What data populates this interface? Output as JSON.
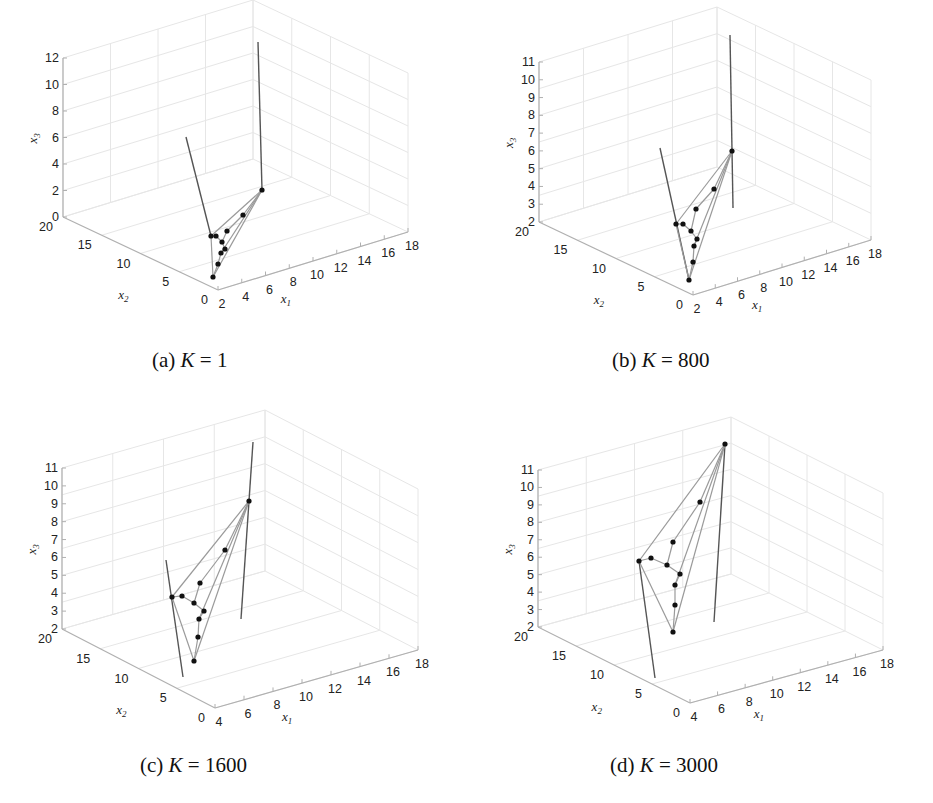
{
  "chart_data": [
    {
      "type": "scatter3d",
      "panel": "a",
      "caption": {
        "prefix": "(a) ",
        "var": "K",
        "eq": " = ",
        "value": "1"
      },
      "xlabel": "x1",
      "ylabel": "x2",
      "zlabel": "x3",
      "x1_ticks": [
        "2",
        "4",
        "6",
        "8",
        "10",
        "12",
        "14",
        "16",
        "18"
      ],
      "x2_ticks": [
        "0",
        "5",
        "10",
        "15",
        "20"
      ],
      "x3_ticks": [
        "0",
        "2",
        "4",
        "6",
        "8",
        "10",
        "12"
      ],
      "xlim": [
        2,
        18
      ],
      "ylim": [
        0,
        20
      ],
      "zlim": [
        0,
        12
      ],
      "grid": true,
      "points_px": [
        [
          262,
          190
        ],
        [
          243,
          215
        ],
        [
          227,
          231
        ],
        [
          211,
          236
        ],
        [
          216,
          236
        ],
        [
          222,
          242
        ],
        [
          225,
          249
        ],
        [
          221,
          253
        ],
        [
          218,
          264
        ],
        [
          213,
          277
        ]
      ],
      "rods_px": [
        [
          [
            186,
            137
          ],
          [
            211,
            236
          ]
        ],
        [
          [
            258,
            42
          ],
          [
            262,
            190
          ]
        ]
      ]
    },
    {
      "type": "scatter3d",
      "panel": "b",
      "caption": {
        "prefix": "(b) ",
        "var": "K",
        "eq": " = ",
        "value": "800"
      },
      "xlabel": "x1",
      "ylabel": "x2",
      "zlabel": "x3",
      "x1_ticks": [
        "2",
        "4",
        "6",
        "8",
        "10",
        "12",
        "14",
        "16",
        "18"
      ],
      "x2_ticks": [
        "0",
        "5",
        "10",
        "15",
        "20"
      ],
      "x3_ticks": [
        "2",
        "3",
        "4",
        "5",
        "6",
        "7",
        "8",
        "9",
        "10",
        "11"
      ],
      "xlim": [
        2,
        18
      ],
      "ylim": [
        0,
        20
      ],
      "zlim": [
        2,
        11
      ],
      "grid": true,
      "points_px": [
        [
          732,
          151
        ],
        [
          714,
          189
        ],
        [
          696,
          209
        ],
        [
          676,
          224
        ],
        [
          683,
          224
        ],
        [
          691,
          231
        ],
        [
          697,
          239
        ],
        [
          694,
          246
        ],
        [
          693,
          262
        ],
        [
          689,
          280
        ]
      ],
      "rods_px": [
        [
          [
            660,
            148
          ],
          [
            689,
            280
          ]
        ],
        [
          [
            730,
            35
          ],
          [
            733,
            208
          ]
        ]
      ]
    },
    {
      "type": "scatter3d",
      "panel": "c",
      "caption": {
        "prefix": "(c) ",
        "var": "K",
        "eq": " = ",
        "value": "1600"
      },
      "xlabel": "x1",
      "ylabel": "x2",
      "zlabel": "x3",
      "x1_ticks": [
        "4",
        "6",
        "8",
        "10",
        "12",
        "14",
        "16",
        "18"
      ],
      "x2_ticks": [
        "0",
        "5",
        "10",
        "15",
        "20"
      ],
      "x3_ticks": [
        "2",
        "3",
        "4",
        "5",
        "6",
        "7",
        "8",
        "9",
        "10",
        "11"
      ],
      "xlim": [
        4,
        18
      ],
      "ylim": [
        0,
        20
      ],
      "zlim": [
        2,
        11
      ],
      "grid": true,
      "points_px": [
        [
          249,
          501
        ],
        [
          225,
          550
        ],
        [
          200,
          583
        ],
        [
          172,
          597
        ],
        [
          182,
          596
        ],
        [
          194,
          603
        ],
        [
          204,
          611
        ],
        [
          199,
          619
        ],
        [
          198,
          637
        ],
        [
          194,
          661
        ]
      ],
      "rods_px": [
        [
          [
            166,
            560
          ],
          [
            183,
            677
          ]
        ],
        [
          [
            253,
            442
          ],
          [
            241,
            619
          ]
        ]
      ]
    },
    {
      "type": "scatter3d",
      "panel": "d",
      "caption": {
        "prefix": "(d) ",
        "var": "K",
        "eq": " = ",
        "value": "3000"
      },
      "xlabel": "x1",
      "ylabel": "x2",
      "zlabel": "x3",
      "x1_ticks": [
        "4",
        "6",
        "8",
        "10",
        "12",
        "14",
        "16",
        "18"
      ],
      "x2_ticks": [
        "0",
        "5",
        "10",
        "15",
        "20"
      ],
      "x3_ticks": [
        "2",
        "3",
        "4",
        "5",
        "6",
        "7",
        "8",
        "9",
        "10",
        "11"
      ],
      "xlim": [
        4,
        18
      ],
      "ylim": [
        0,
        20
      ],
      "zlim": [
        2,
        11
      ],
      "grid": true,
      "points_px": [
        [
          725,
          444
        ],
        [
          700,
          502
        ],
        [
          673,
          542
        ],
        [
          639,
          561
        ],
        [
          651,
          558
        ],
        [
          667,
          565
        ],
        [
          680,
          574
        ],
        [
          675,
          585
        ],
        [
          675,
          605
        ],
        [
          673,
          632
        ]
      ],
      "rods_px": [
        [
          [
            639,
            561
          ],
          [
            655,
            678
          ]
        ],
        [
          [
            725,
            444
          ],
          [
            714,
            622
          ]
        ]
      ]
    }
  ],
  "panels": [
    {
      "id": "a",
      "caption_prefix": "(a) ",
      "caption_var": "K",
      "caption_rest": " = 1"
    },
    {
      "id": "b",
      "caption_prefix": "(b) ",
      "caption_var": "K",
      "caption_rest": " = 800"
    },
    {
      "id": "c",
      "caption_prefix": "(c) ",
      "caption_var": "K",
      "caption_rest": " = 1600"
    },
    {
      "id": "d",
      "caption_prefix": "(d) ",
      "caption_var": "K",
      "caption_rest": " = 3000"
    }
  ],
  "axis_labels": {
    "x_main": "x",
    "x1_sub": "1",
    "x2_sub": "2",
    "x3_sub": "3"
  },
  "colors": {
    "points": "#111111",
    "lines": "#9a9a9a",
    "rods": "#555555",
    "axes": "#b0b0b0",
    "grid": "#e6e6e6"
  }
}
